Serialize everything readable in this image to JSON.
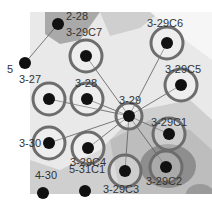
{
  "diagram": {
    "colors": {
      "background": "#ffffff",
      "map_light": "#e9e9e9",
      "map_mid": "#cfcfcf",
      "map_dark": "#a9a9a9",
      "map_darkest": "#8e8e8e",
      "ring": "#6d6d6d",
      "node": "#111111",
      "edge": "#5a5a5a",
      "label": "#333333"
    },
    "nodes": [
      {
        "id": "2-28",
        "label": "2-28",
        "x": 58,
        "y": 24,
        "ring": false
      },
      {
        "id": "5",
        "label": "5",
        "x": 25,
        "y": 63,
        "ring": false
      },
      {
        "id": "3-29C7",
        "label": "3-29C7",
        "x": 86,
        "y": 56,
        "ring": true
      },
      {
        "id": "3-29C6",
        "label": "3-29C6",
        "x": 167,
        "y": 43,
        "ring": true
      },
      {
        "id": "3-29C5",
        "label": "3-29C5",
        "x": 181,
        "y": 85,
        "ring": true
      },
      {
        "id": "3-27",
        "label": "3-27",
        "x": 49,
        "y": 99,
        "ring": true
      },
      {
        "id": "3-28",
        "label": "3-28",
        "x": 87,
        "y": 99,
        "ring": true
      },
      {
        "id": "3-29",
        "label": "3-29",
        "x": 129,
        "y": 116,
        "ring": true
      },
      {
        "id": "3-29C1",
        "label": "3-29C1",
        "x": 169,
        "y": 134,
        "ring": true
      },
      {
        "id": "3-30",
        "label": "3-30",
        "x": 49,
        "y": 143,
        "ring": true
      },
      {
        "id": "3-29C4",
        "label": "3-29C4",
        "x": 88,
        "y": 148,
        "ring": true
      },
      {
        "id": "3-29C2",
        "label": "3-29C2",
        "x": 166,
        "y": 167,
        "ring": true
      },
      {
        "id": "3-29C3",
        "label": "3-29C3",
        "x": 125,
        "y": 171,
        "ring": true
      },
      {
        "id": "4-30",
        "label": "4-30",
        "x": 43,
        "y": 193,
        "ring": false
      },
      {
        "id": "5-31C1",
        "label": "5-31C1",
        "x": 85,
        "y": 191,
        "ring": false
      }
    ],
    "edges": [
      [
        "2-28",
        "5"
      ],
      [
        "3-29C7",
        "3-29"
      ],
      [
        "3-29C6",
        "3-29"
      ],
      [
        "3-29C5",
        "3-29"
      ],
      [
        "3-27",
        "3-29"
      ],
      [
        "3-28",
        "3-29"
      ],
      [
        "3-29",
        "3-29C1"
      ],
      [
        "3-30",
        "3-29"
      ],
      [
        "3-29C4",
        "3-29"
      ],
      [
        "3-29C2",
        "3-29"
      ],
      [
        "3-29C3",
        "3-29"
      ]
    ]
  }
}
